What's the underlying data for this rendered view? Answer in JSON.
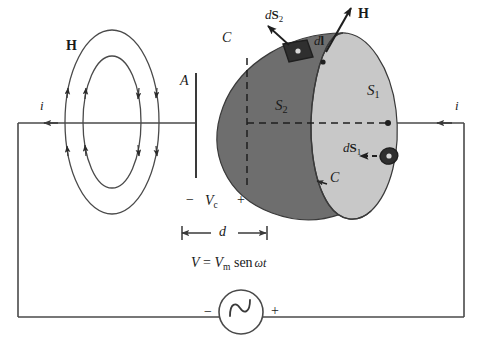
{
  "figure": {
    "colors": {
      "surface_s2_fill": "#6e6e6e",
      "surface_s1_fill": "#c8c8c8",
      "stroke": "#3a3a3a",
      "text": "#1a1a1a",
      "background": "#ffffff"
    }
  },
  "labels": {
    "h_field_left": "H",
    "h_field_right": "H",
    "current_left": "i",
    "current_right": "i",
    "plate_a": "A",
    "contour_top": "C",
    "contour_bottom": "C",
    "surface_s1": "S",
    "surface_s1_sub": "1",
    "surface_s2": "S",
    "surface_s2_sub": "2",
    "ds1": "dS",
    "ds1_sub": "1",
    "ds2": "dS",
    "ds2_sub": "2",
    "dl": "dl",
    "gap_distance": "d",
    "cap_minus": "−",
    "cap_voltage": "V",
    "cap_voltage_sub": "c",
    "cap_plus": "+",
    "source_minus": "−",
    "source_plus": "+",
    "source_symbol": "∿",
    "equation_v": "V",
    "equation_eq": "=",
    "equation_vm": "V",
    "equation_vm_sub": "m",
    "equation_sen": "sen",
    "equation_omega_t": "ωt"
  },
  "equation_full": "V = Vm sen ωt",
  "geometry": {
    "circuit": {
      "left_x": 18,
      "right_x": 464,
      "top_y": 123,
      "bottom_y": 317
    },
    "plate_a": {
      "x": 196,
      "y_top": 73,
      "y_bottom": 178
    },
    "gap_dim": {
      "x_left": 182,
      "x_right": 267,
      "y": 233
    },
    "source": {
      "cx": 241,
      "cy": 312,
      "r": 22
    }
  }
}
